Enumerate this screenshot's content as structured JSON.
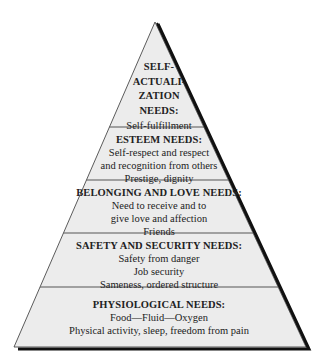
{
  "diagram": {
    "colors": {
      "fill": "#ececec",
      "outline": "#222222",
      "shadow": "#111111",
      "divider": "#555555"
    },
    "tiers": [
      {
        "title_lines": [
          "SELF-",
          "ACTUALI-",
          "ZATION",
          "NEEDS:"
        ],
        "lines": [
          "Self-fulfillment"
        ]
      },
      {
        "title": "ESTEEM NEEDS:",
        "lines": [
          "Self-respect and respect",
          "and recognition from others",
          "Prestige, dignity"
        ]
      },
      {
        "title": "BELONGING AND LOVE NEEDS:",
        "lines": [
          "Need to receive and to",
          "give love and affection",
          "Friends"
        ]
      },
      {
        "title": "SAFETY AND SECURITY NEEDS:",
        "lines": [
          "Safety from danger",
          "Job security",
          "Sameness, ordered structure"
        ]
      },
      {
        "title": "PHYSIOLOGICAL NEEDS:",
        "lines": [
          "Food—Fluid—Oxygen",
          "Physical activity, sleep, freedom from pain"
        ]
      }
    ]
  }
}
